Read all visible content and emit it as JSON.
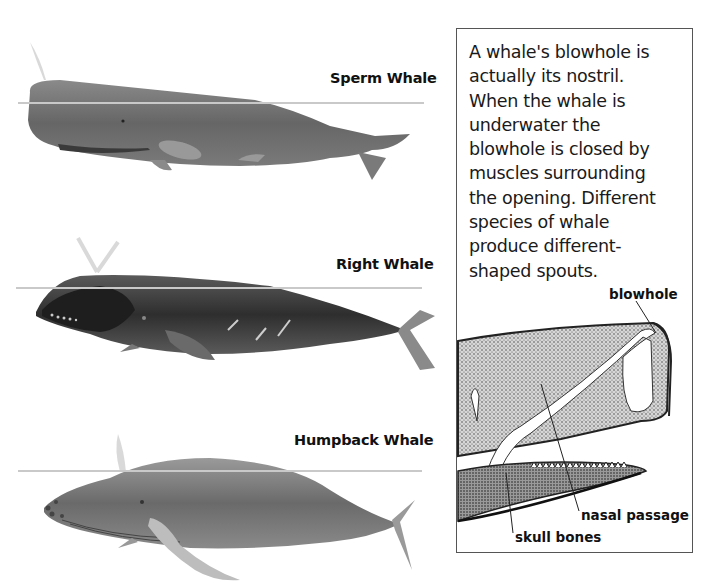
{
  "whales": [
    {
      "name": "Sperm Whale",
      "spout": "single angled forward"
    },
    {
      "name": "Right Whale",
      "spout": "V-shaped"
    },
    {
      "name": "Humpback Whale",
      "spout": "single vertical bushy"
    }
  ],
  "info_box": {
    "text": "A whale's blowhole is actually its nostril. When the whale is underwater the blowhole is closed by muscles surrounding the opening. Different species of whale produce different-shaped spouts.",
    "lines": [
      "A whale's blowhole is",
      "actually its nostril.",
      "When the whale is",
      "underwater the",
      "blowhole is closed by",
      "muscles surrounding",
      "the opening. Different",
      "species of whale",
      "produce different-",
      "shaped spouts."
    ]
  },
  "diagram_labels": {
    "blowhole": "blowhole",
    "nasal_passage": "nasal passage",
    "skull_bones": "skull bones"
  },
  "colors": {
    "waterline": "#c9c9c9",
    "whale_body": "#6e6e6e",
    "box_border": "#555555",
    "text": "#111111"
  }
}
